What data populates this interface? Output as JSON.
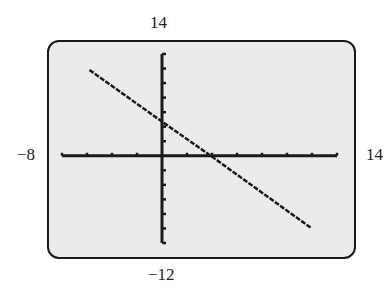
{
  "chart_data": {
    "type": "line",
    "title": "",
    "xlabel": "",
    "ylabel": "",
    "xlim": [
      -8,
      14
    ],
    "ylim": [
      -12,
      14
    ],
    "window_labels": {
      "ymax": "14",
      "ymin": "−12",
      "xmin": "−8",
      "xmax": "14"
    },
    "x_tick_spacing": 2,
    "y_tick_spacing": 2,
    "grid": false,
    "series": [
      {
        "name": "line",
        "x": [
          -5.8,
          0,
          3.9,
          11.9
        ],
        "y": [
          11.8,
          4.7,
          0,
          -9.9
        ]
      }
    ],
    "style": {
      "background": "#ebebeb",
      "line_color": "#1a1a1a"
    }
  }
}
